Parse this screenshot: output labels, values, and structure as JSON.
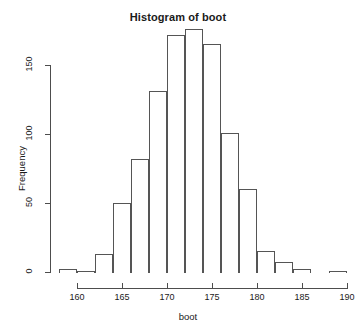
{
  "chart_data": {
    "type": "bar",
    "title": "Histogram of boot",
    "xlabel": "boot",
    "ylabel": "Frequency",
    "xlim": [
      158,
      190
    ],
    "ylim": [
      0,
      180
    ],
    "grid": false,
    "legend": null,
    "bin_width": 2,
    "x_ticks": [
      160,
      165,
      170,
      175,
      180,
      185,
      190
    ],
    "x_tick_labels": [
      "160",
      "165",
      "170",
      "175",
      "180",
      "185",
      "190"
    ],
    "y_ticks": [
      0,
      50,
      100,
      150
    ],
    "y_tick_labels": [
      "0",
      "50",
      "100",
      "150"
    ],
    "bin_edges": [
      158,
      160,
      162,
      164,
      166,
      168,
      170,
      172,
      174,
      176,
      178,
      180,
      182,
      184,
      186,
      188,
      190
    ],
    "categories": [
      "158-160",
      "160-162",
      "162-164",
      "164-166",
      "166-168",
      "168-170",
      "170-172",
      "172-174",
      "174-176",
      "176-178",
      "178-180",
      "180-182",
      "182-184",
      "184-186",
      "186-188",
      "188-190"
    ],
    "values": [
      2,
      1,
      13,
      50,
      82,
      131,
      172,
      176,
      165,
      101,
      60,
      15,
      7,
      2,
      0,
      1
    ],
    "bar_color": "#ffffff",
    "bar_edge_color": "#555555",
    "axis_color": "#4d4d4d",
    "text_color": "#1a1a1a",
    "background": "#ffffff"
  }
}
